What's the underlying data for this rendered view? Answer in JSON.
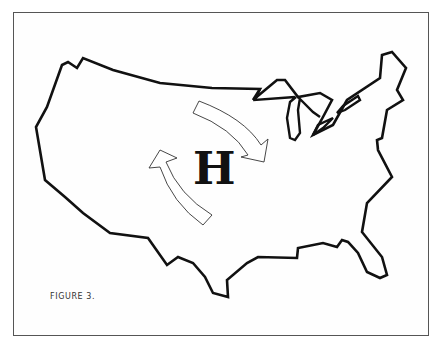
{
  "figure": {
    "caption": "FIGURE 3.",
    "pressure_system": {
      "label": "H",
      "meaning": "high-pressure center"
    },
    "arrows": [
      {
        "name": "upper-arrow",
        "direction": "clockwise, pointing southeast"
      },
      {
        "name": "lower-arrow",
        "direction": "clockwise, pointing northwest"
      }
    ],
    "map_subject": "Contiguous United States outline with Great Lakes",
    "colors": {
      "outline": "#111111",
      "background": "#ffffff",
      "frame": "#555555"
    }
  }
}
